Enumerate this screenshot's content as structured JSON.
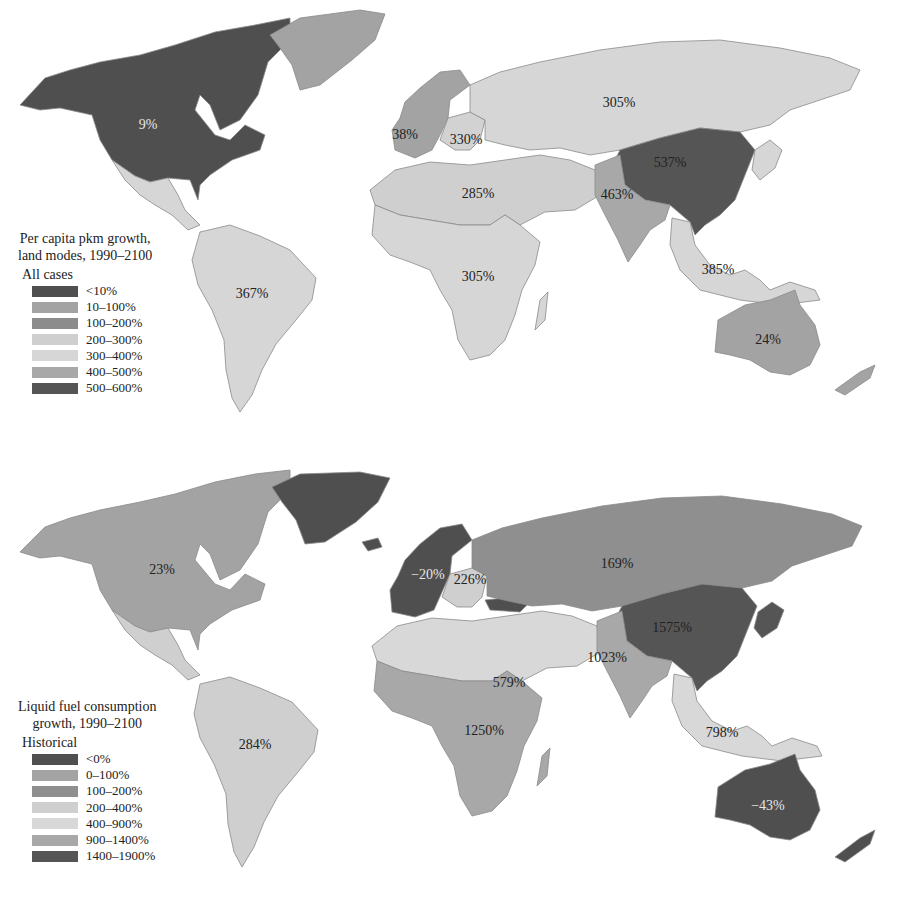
{
  "maps": {
    "top": {
      "legend": {
        "title_line1": "Per capita pkm growth,",
        "title_line2": "land modes, 1990–2100",
        "subtitle": "All cases",
        "items": [
          {
            "label": "<10%",
            "color": "#4f4f4f"
          },
          {
            "label": "10–100%",
            "color": "#a3a3a3"
          },
          {
            "label": "100–200%",
            "color": "#8c8c8c"
          },
          {
            "label": "200–300%",
            "color": "#cfcfcf"
          },
          {
            "label": "300–400%",
            "color": "#d6d6d6"
          },
          {
            "label": "400–500%",
            "color": "#a8a8a8"
          },
          {
            "label": "500–600%",
            "color": "#555555"
          }
        ]
      },
      "regions": [
        {
          "name": "North America",
          "value": "9%",
          "color": "#4f4f4f",
          "label_color": "light"
        },
        {
          "name": "Greenland",
          "value": "",
          "color": "#a3a3a3"
        },
        {
          "name": "Western Europe",
          "value": "38%",
          "color": "#a3a3a3"
        },
        {
          "name": "Eastern Europe",
          "value": "330%",
          "color": "#d2d2d2"
        },
        {
          "name": "Former Soviet Union",
          "value": "305%",
          "color": "#d6d6d6"
        },
        {
          "name": "China",
          "value": "537%",
          "color": "#555555"
        },
        {
          "name": "Middle East / North Africa",
          "value": "285%",
          "color": "#cfcfcf"
        },
        {
          "name": "South Asia",
          "value": "463%",
          "color": "#a8a8a8"
        },
        {
          "name": "Sub-Saharan Africa",
          "value": "305%",
          "color": "#d6d6d6"
        },
        {
          "name": "Latin America",
          "value": "367%",
          "color": "#d6d6d6"
        },
        {
          "name": "Other Pacific Asia",
          "value": "385%",
          "color": "#d6d6d6"
        },
        {
          "name": "Pacific OECD",
          "value": "24%",
          "color": "#a3a3a3"
        }
      ]
    },
    "bottom": {
      "legend": {
        "title_line1": "Liquid fuel consumption",
        "title_line2": "growth, 1990–2100",
        "subtitle": "Historical",
        "items": [
          {
            "label": "<0%",
            "color": "#4f4f4f"
          },
          {
            "label": "0–100%",
            "color": "#a3a3a3"
          },
          {
            "label": "100–200%",
            "color": "#8f8f8f"
          },
          {
            "label": "200–400%",
            "color": "#cfcfcf"
          },
          {
            "label": "400–900%",
            "color": "#d8d8d8"
          },
          {
            "label": "900–1400%",
            "color": "#a8a8a8"
          },
          {
            "label": "1400–1900%",
            "color": "#555555"
          }
        ]
      },
      "regions": [
        {
          "name": "North America",
          "value": "23%",
          "color": "#a3a3a3"
        },
        {
          "name": "Greenland",
          "value": "",
          "color": "#4f4f4f"
        },
        {
          "name": "Western Europe",
          "value": "−20%",
          "color": "#4f4f4f",
          "label_color": "light"
        },
        {
          "name": "Eastern Europe",
          "value": "226%",
          "color": "#cfcfcf"
        },
        {
          "name": "Former Soviet Union",
          "value": "169%",
          "color": "#8f8f8f"
        },
        {
          "name": "China",
          "value": "1575%",
          "color": "#555555"
        },
        {
          "name": "Middle East / North Africa",
          "value": "579%",
          "color": "#d8d8d8"
        },
        {
          "name": "South Asia",
          "value": "1023%",
          "color": "#a8a8a8"
        },
        {
          "name": "Sub-Saharan Africa",
          "value": "1250%",
          "color": "#a8a8a8"
        },
        {
          "name": "Latin America",
          "value": "284%",
          "color": "#cfcfcf"
        },
        {
          "name": "Other Pacific Asia",
          "value": "798%",
          "color": "#d8d8d8"
        },
        {
          "name": "Pacific OECD",
          "value": "−43%",
          "color": "#4f4f4f",
          "label_color": "light"
        }
      ]
    }
  }
}
